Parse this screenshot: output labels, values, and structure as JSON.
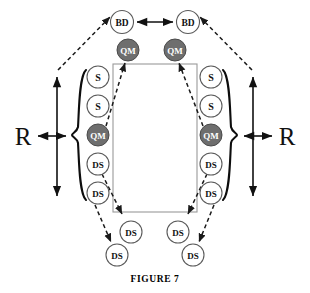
{
  "figure": {
    "caption": "FIGURE 7",
    "width": 310,
    "height": 293,
    "background": "#ffffff"
  },
  "colors": {
    "node_open_fill": "#ffffff",
    "node_open_stroke": "#5a5a5a",
    "node_filled_fill": "#6e6e6e",
    "node_filled_stroke": "#4a4a4a",
    "node_label_dark": "#111111",
    "node_label_light": "#ffffff",
    "arrow_solid": "#111111",
    "arrow_dashed": "#1a1a1a",
    "box_stroke": "#9a9a9a",
    "brace_stroke": "#0d0d0d"
  },
  "nodes": [
    {
      "id": "bd-left",
      "label": "BD",
      "style": "open",
      "cx": 122,
      "cy": 22,
      "r": 11.5,
      "font_size": 9.5
    },
    {
      "id": "bd-right",
      "label": "BD",
      "style": "open",
      "cx": 188,
      "cy": 22,
      "r": 11.5,
      "font_size": 9.5
    },
    {
      "id": "qm-top-left",
      "label": "QM",
      "style": "filled",
      "cx": 128,
      "cy": 50,
      "r": 11.0,
      "font_size": 9.0
    },
    {
      "id": "qm-top-right",
      "label": "QM",
      "style": "filled",
      "cx": 175,
      "cy": 50,
      "r": 11.0,
      "font_size": 9.0
    },
    {
      "id": "s-left-1",
      "label": "S",
      "style": "open",
      "cx": 98,
      "cy": 77,
      "r": 11.0,
      "font_size": 10.0
    },
    {
      "id": "s-left-2",
      "label": "S",
      "style": "open",
      "cx": 98,
      "cy": 106,
      "r": 11.0,
      "font_size": 10.0
    },
    {
      "id": "qm-left",
      "label": "QM",
      "style": "filled",
      "cx": 98,
      "cy": 135,
      "r": 11.0,
      "font_size": 9.0
    },
    {
      "id": "ds-left-1",
      "label": "DS",
      "style": "open",
      "cx": 98,
      "cy": 164,
      "r": 11.0,
      "font_size": 9.0
    },
    {
      "id": "ds-left-2",
      "label": "DS",
      "style": "open",
      "cx": 98,
      "cy": 193,
      "r": 11.0,
      "font_size": 9.0
    },
    {
      "id": "s-right-1",
      "label": "S",
      "style": "open",
      "cx": 211,
      "cy": 77,
      "r": 11.0,
      "font_size": 10.0
    },
    {
      "id": "s-right-2",
      "label": "S",
      "style": "open",
      "cx": 211,
      "cy": 106,
      "r": 11.0,
      "font_size": 10.0
    },
    {
      "id": "qm-right",
      "label": "QM",
      "style": "filled",
      "cx": 211,
      "cy": 135,
      "r": 11.0,
      "font_size": 9.0
    },
    {
      "id": "ds-right-1",
      "label": "DS",
      "style": "open",
      "cx": 211,
      "cy": 164,
      "r": 11.0,
      "font_size": 9.0
    },
    {
      "id": "ds-right-2",
      "label": "DS",
      "style": "open",
      "cx": 211,
      "cy": 193,
      "r": 11.0,
      "font_size": 9.0
    },
    {
      "id": "ds-bottom-in-left",
      "label": "DS",
      "style": "open",
      "cx": 131,
      "cy": 232,
      "r": 11.0,
      "font_size": 9.0
    },
    {
      "id": "ds-bottom-in-right",
      "label": "DS",
      "style": "open",
      "cx": 178,
      "cy": 232,
      "r": 11.0,
      "font_size": 9.0
    },
    {
      "id": "ds-bottom-out-left",
      "label": "DS",
      "style": "open",
      "cx": 117,
      "cy": 255,
      "r": 11.0,
      "font_size": 9.0
    },
    {
      "id": "ds-bottom-out-right",
      "label": "DS",
      "style": "open",
      "cx": 193,
      "cy": 255,
      "r": 11.0,
      "font_size": 9.0
    }
  ],
  "center_box": {
    "x": 113,
    "y": 64,
    "width": 84,
    "height": 148
  },
  "braces": [
    {
      "id": "brace-left",
      "side": "left",
      "x": 79,
      "top": 70,
      "bottom": 200,
      "tip": 72
    },
    {
      "id": "brace-right",
      "side": "right",
      "x": 230,
      "top": 70,
      "bottom": 200,
      "tip": 237
    }
  ],
  "r_labels": [
    {
      "id": "r-left",
      "text": "R",
      "x": 23,
      "y": 136
    },
    {
      "id": "r-right",
      "text": "R",
      "x": 287,
      "y": 136
    }
  ],
  "solid_arrows": [
    {
      "id": "arrow-bd-to-bd",
      "x1": 137,
      "y1": 22,
      "x2": 173,
      "y2": 22,
      "heads": "both"
    },
    {
      "id": "arrow-r-left-vertical",
      "x1": 57,
      "y1": 77,
      "x2": 57,
      "y2": 196,
      "heads": "both"
    },
    {
      "id": "arrow-r-right-vertical",
      "x1": 253,
      "y1": 77,
      "x2": 253,
      "y2": 196,
      "heads": "both"
    },
    {
      "id": "arrow-r-left-to-brace",
      "x1": 38,
      "y1": 136,
      "x2": 66,
      "y2": 136,
      "heads": "both"
    },
    {
      "id": "arrow-r-right-to-brace",
      "x1": 244,
      "y1": 136,
      "x2": 272,
      "y2": 136,
      "heads": "both"
    }
  ],
  "dashed_arrows": [
    {
      "id": "dash-r-left-to-bd",
      "x1": 58,
      "y1": 70,
      "x2": 110,
      "y2": 17,
      "head": "end"
    },
    {
      "id": "dash-r-right-to-bd",
      "x1": 252,
      "y1": 70,
      "x2": 200,
      "y2": 17,
      "head": "end"
    },
    {
      "id": "dash-qm-left-to-qm-top",
      "x1": 106,
      "y1": 126,
      "x2": 125,
      "y2": 63,
      "head": "end"
    },
    {
      "id": "dash-qm-right-to-qm-top",
      "x1": 203,
      "y1": 126,
      "x2": 179,
      "y2": 63,
      "head": "end"
    },
    {
      "id": "dash-ds-left-to-box",
      "x1": 102,
      "y1": 174,
      "x2": 122,
      "y2": 214,
      "head": "end"
    },
    {
      "id": "dash-ds-right-to-box",
      "x1": 207,
      "y1": 174,
      "x2": 188,
      "y2": 214,
      "head": "end"
    },
    {
      "id": "dash-ds-left-to-ds-out",
      "x1": 95,
      "y1": 205,
      "x2": 111,
      "y2": 242,
      "head": "end"
    },
    {
      "id": "dash-ds-right-to-ds-out",
      "x1": 214,
      "y1": 205,
      "x2": 199,
      "y2": 242,
      "head": "end"
    }
  ]
}
